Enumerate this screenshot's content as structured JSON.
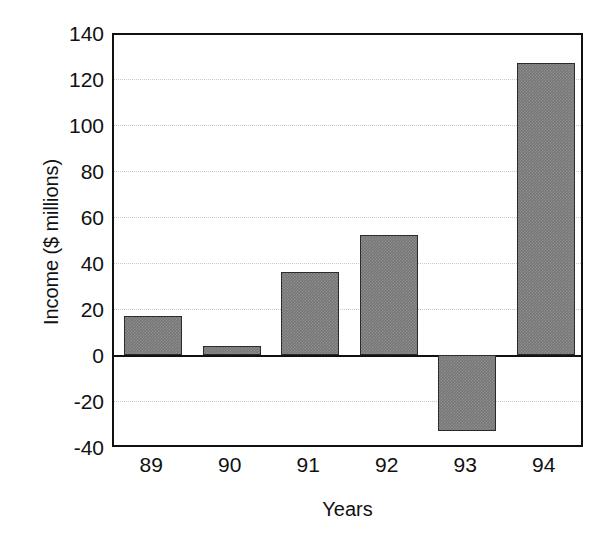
{
  "chart_data": {
    "type": "bar",
    "title": "",
    "xlabel": "Years",
    "ylabel": "Income ($ millions)",
    "categories": [
      "89",
      "90",
      "91",
      "92",
      "93",
      "94"
    ],
    "values": [
      17,
      4,
      36,
      52,
      -33,
      127
    ],
    "series": [
      {
        "name": "Income",
        "values": [
          17,
          4,
          36,
          52,
          -33,
          127
        ]
      }
    ],
    "ylim": [
      -40,
      140
    ],
    "yticks": [
      140,
      120,
      100,
      80,
      60,
      40,
      20,
      0,
      -20,
      -40
    ],
    "ytick_labels": [
      "140",
      "120",
      "100",
      "80",
      "60",
      "40",
      "20",
      "0",
      "-20",
      "-40"
    ],
    "xtick_labels": [
      "89",
      "90",
      "91",
      "92",
      "93",
      "94"
    ],
    "grid": true,
    "grid_axis": "y",
    "grid_style": "dotted",
    "legend": false,
    "legend_position": "none",
    "bar_color": "#767676",
    "bar_edge_color": "#2b2b2b",
    "axis_color": "#111111",
    "grid_color": "#c9c9c9",
    "background_color": "#ffffff",
    "zero_line": 0,
    "annotations": []
  },
  "axes": {
    "y_title": "Income ($ millions)",
    "x_title": "Years"
  }
}
